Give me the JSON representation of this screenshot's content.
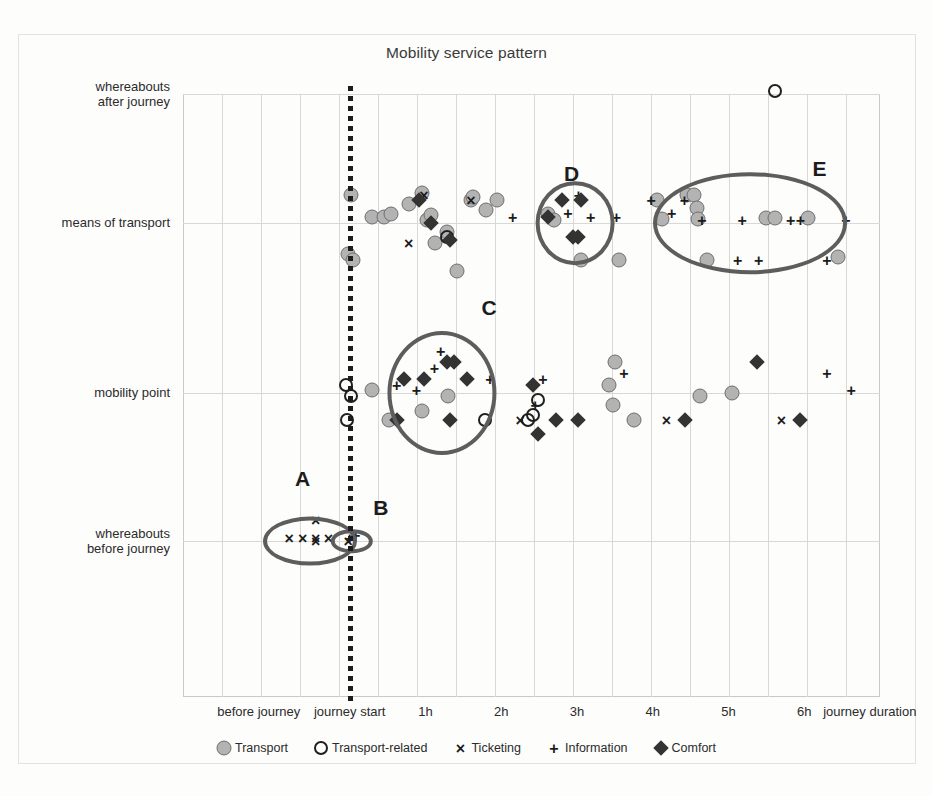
{
  "chart_data": {
    "type": "scatter",
    "title": "Mobility service pattern",
    "xlabel": "journey duration",
    "ylabel": "",
    "grid": true,
    "legend_position": "bottom",
    "x_tick_labels": [
      "before journey",
      "journey start",
      "1h",
      "2h",
      "3h",
      "4h",
      "5h",
      "6h"
    ],
    "x_tick_values": [
      -1.2,
      0,
      1,
      2,
      3,
      4,
      5,
      6
    ],
    "y_categories": [
      "whereabouts before journey",
      "mobility point",
      "means of transport",
      "whereabouts after journey"
    ],
    "xlim": [
      -2.2,
      7.0
    ],
    "annotation_journey_start": "journey start",
    "series": [
      {
        "name": "Transport",
        "marker": "filled-circle",
        "color": "#b3b3b3",
        "edge": "#6e6e6e",
        "points": [
          [
            0.02,
            2.22
          ],
          [
            -0.02,
            1.82
          ],
          [
            0.05,
            1.78
          ],
          [
            0.3,
            2.05
          ],
          [
            0.45,
            2.05
          ],
          [
            0.55,
            2.07
          ],
          [
            0.78,
            2.15
          ],
          [
            0.95,
            2.23
          ],
          [
            1.02,
            2.02
          ],
          [
            1.07,
            2.06
          ],
          [
            1.12,
            1.88
          ],
          [
            1.28,
            1.95
          ],
          [
            1.42,
            1.72
          ],
          [
            1.6,
            2.18
          ],
          [
            1.63,
            2.2
          ],
          [
            1.8,
            2.1
          ],
          [
            1.95,
            2.18
          ],
          [
            2.62,
            2.07
          ],
          [
            2.7,
            2.02
          ],
          [
            3.05,
            1.78
          ],
          [
            3.55,
            1.78
          ],
          [
            4.05,
            2.18
          ],
          [
            4.12,
            2.03
          ],
          [
            4.45,
            2.22
          ],
          [
            4.55,
            2.22
          ],
          [
            4.58,
            2.12
          ],
          [
            4.6,
            2.03
          ],
          [
            4.72,
            1.78
          ],
          [
            5.5,
            2.04
          ],
          [
            5.62,
            2.04
          ],
          [
            6.05,
            2.04
          ],
          [
            6.45,
            1.8
          ],
          [
            0.3,
            1.02
          ],
          [
            0.52,
            0.82
          ],
          [
            1.3,
            0.98
          ],
          [
            3.42,
            1.05
          ],
          [
            3.5,
            1.18
          ],
          [
            3.48,
            0.92
          ],
          [
            3.75,
            0.82
          ],
          [
            4.62,
            0.98
          ],
          [
            5.05,
            1.0
          ],
          [
            0.95,
            0.88
          ]
        ]
      },
      {
        "name": "Transport-related",
        "marker": "open-circle",
        "color": "#1f1f1f",
        "points": [
          [
            1.28,
            1.92
          ],
          [
            5.62,
            3.02
          ],
          [
            -0.05,
            1.05
          ],
          [
            0.02,
            0.98
          ],
          [
            -0.04,
            0.82
          ],
          [
            1.78,
            0.82
          ],
          [
            2.35,
            0.82
          ],
          [
            2.42,
            0.85
          ],
          [
            2.48,
            0.95
          ]
        ]
      },
      {
        "name": "Ticketing",
        "marker": "cross",
        "color": "#1c1c1c",
        "points": [
          [
            -0.8,
            0.02
          ],
          [
            -0.62,
            0.02
          ],
          [
            -0.45,
            0.02
          ],
          [
            -0.28,
            0.02
          ],
          [
            -0.45,
            0.14
          ],
          [
            -0.45,
            -0.12
          ],
          [
            0.98,
            2.22
          ],
          [
            0.78,
            1.88
          ],
          [
            1.6,
            2.18
          ],
          [
            2.25,
            0.82
          ],
          [
            4.18,
            0.82
          ],
          [
            5.7,
            0.82
          ],
          [
            -0.02,
            0.0
          ]
        ]
      },
      {
        "name": "Information",
        "marker": "plus",
        "color": "#1c1c1c",
        "points": [
          [
            0.0,
            0.02
          ],
          [
            0.08,
            0.04
          ],
          [
            2.15,
            2.05
          ],
          [
            2.88,
            2.08
          ],
          [
            3.02,
            2.22
          ],
          [
            3.18,
            2.05
          ],
          [
            3.52,
            2.05
          ],
          [
            3.98,
            2.18
          ],
          [
            4.25,
            2.08
          ],
          [
            4.42,
            2.18
          ],
          [
            4.65,
            2.02
          ],
          [
            5.18,
            2.02
          ],
          [
            5.4,
            1.78
          ],
          [
            5.82,
            2.02
          ],
          [
            5.95,
            2.02
          ],
          [
            6.3,
            1.78
          ],
          [
            6.55,
            2.02
          ],
          [
            5.12,
            1.78
          ],
          [
            1.12,
            1.15
          ],
          [
            1.2,
            1.25
          ],
          [
            0.88,
            1.02
          ],
          [
            1.85,
            1.08
          ],
          [
            2.45,
            0.92
          ],
          [
            3.62,
            1.12
          ],
          [
            6.3,
            1.12
          ],
          [
            6.62,
            1.02
          ],
          [
            2.55,
            1.08
          ],
          [
            0.62,
            1.05
          ]
        ]
      },
      {
        "name": "Comfort",
        "marker": "diamond",
        "color": "#333333",
        "points": [
          [
            1.08,
            2.0
          ],
          [
            2.62,
            2.05
          ],
          [
            2.8,
            2.18
          ],
          [
            3.05,
            2.18
          ],
          [
            2.95,
            1.92
          ],
          [
            3.02,
            1.92
          ],
          [
            1.32,
            1.9
          ],
          [
            0.72,
            1.08
          ],
          [
            0.98,
            1.08
          ],
          [
            1.28,
            1.18
          ],
          [
            1.38,
            1.18
          ],
          [
            1.55,
            1.08
          ],
          [
            0.62,
            0.82
          ],
          [
            1.32,
            0.82
          ],
          [
            2.42,
            1.05
          ],
          [
            2.72,
            0.82
          ],
          [
            3.02,
            0.82
          ],
          [
            4.42,
            0.82
          ],
          [
            5.38,
            1.18
          ],
          [
            5.95,
            0.82
          ],
          [
            2.48,
            0.72
          ],
          [
            0.92,
            2.18
          ]
        ]
      }
    ],
    "clusters": [
      {
        "label": "A",
        "cx": -0.52,
        "cy": 0.0,
        "rx": 0.62,
        "ry": 0.33,
        "label_dx": -0.1,
        "label_dy": 0.42
      },
      {
        "label": "B",
        "cx": 0.03,
        "cy": 0.0,
        "rx": 0.28,
        "ry": 0.16,
        "label_dx": 0.38,
        "label_dy": 0.22
      },
      {
        "label": "C",
        "cx": 1.22,
        "cy": 1.0,
        "rx": 0.72,
        "ry": 0.39,
        "label_dx": 0.62,
        "label_dy": 0.5
      },
      {
        "label": "D",
        "cx": 2.98,
        "cy": 2.0,
        "rx": 0.52,
        "ry": 0.28,
        "label_dx": -0.05,
        "label_dy": 0.38
      },
      {
        "label": "E",
        "cx": 5.28,
        "cy": 2.0,
        "rx": 1.28,
        "ry": 0.34,
        "label_dx": 0.92,
        "label_dy": 0.42
      }
    ]
  },
  "legend": {
    "items": [
      {
        "label": "Transport",
        "marker": "filled-circle"
      },
      {
        "label": "Transport-related",
        "marker": "open-circle"
      },
      {
        "label": "Ticketing",
        "marker": "cross"
      },
      {
        "label": "Information",
        "marker": "plus"
      },
      {
        "label": "Comfort",
        "marker": "diamond"
      }
    ]
  }
}
